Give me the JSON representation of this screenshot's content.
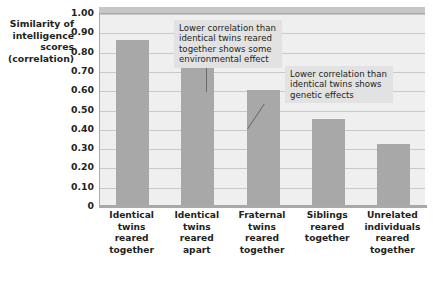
{
  "chart_data": {
    "type": "bar",
    "title": "",
    "xlabel": "",
    "ylabel": "Similarity of intelligence scores (correlation)",
    "ylabel_lines": [
      "Similarity of",
      "intelligence",
      "scores",
      "(correlation)"
    ],
    "categories": [
      "Identical twins reared together",
      "Identical twins reared apart",
      "Fraternal twins reared together",
      "Siblings reared together",
      "Unrelated individuals reared together"
    ],
    "category_lines": [
      [
        "Identical",
        "twins",
        "reared",
        "together"
      ],
      [
        "Identical",
        "twins",
        "reared",
        "apart"
      ],
      [
        "Fraternal",
        "twins",
        "reared",
        "together"
      ],
      [
        "Siblings",
        "reared",
        "together"
      ],
      [
        "Unrelated",
        "individuals",
        "reared",
        "together"
      ]
    ],
    "values": [
      0.86,
      0.72,
      0.6,
      0.45,
      0.32
    ],
    "ylim": [
      0,
      1.0
    ],
    "ytick_values": [
      1.0,
      0.9,
      0.8,
      0.7,
      0.6,
      0.5,
      0.4,
      0.3,
      0.2,
      0.1,
      0
    ],
    "ytick_labels": [
      "1.00",
      "0.90",
      "0.80",
      "0.70",
      "0.60",
      "0.50",
      "0.40",
      "0.30",
      "0.20",
      "0.10",
      "0"
    ],
    "grid": true,
    "legend": "none",
    "bar_color": "#a8a8a8",
    "plot_background": "#efefef",
    "gridline_color": "#c9c9c9",
    "axis_color": "#a9a9a9",
    "annotations": [
      {
        "id": "callout-1",
        "text": "Lower correlation than identical twins reared together shows some environmental effect",
        "lines": [
          "Lower correlation than",
          "identical twins reared",
          "together shows some",
          "environmental effect"
        ],
        "points_to": "Identical twins reared apart"
      },
      {
        "id": "callout-2",
        "text": "Lower correlation than identical twins shows genetic effects",
        "lines": [
          "Lower correlation than",
          "identical twins shows",
          "genetic effects"
        ],
        "points_to": "Fraternal twins reared together"
      }
    ]
  }
}
